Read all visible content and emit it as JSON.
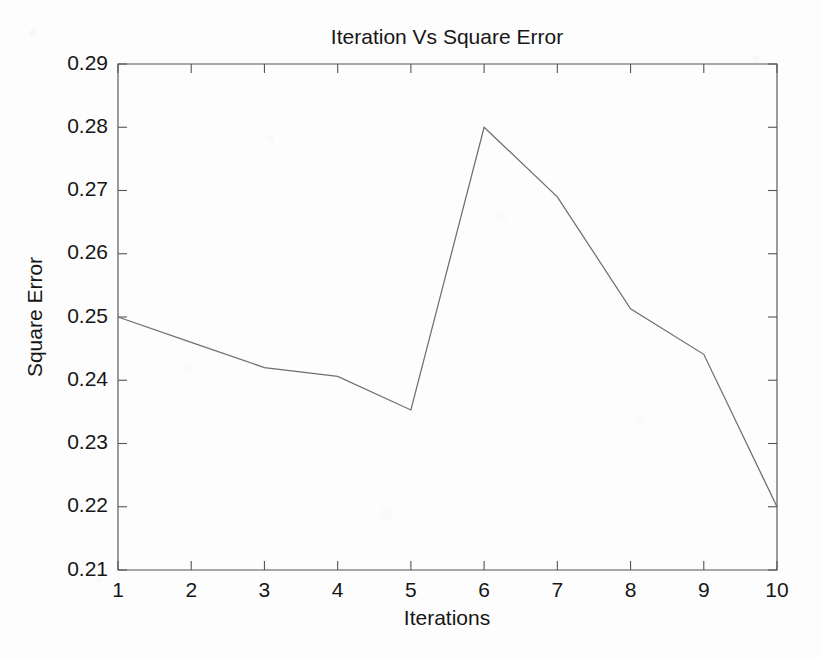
{
  "chart_data": {
    "type": "line",
    "title": "Iteration Vs Square Error",
    "xlabel": "Iterations",
    "ylabel": "Square Error",
    "x": [
      1,
      2,
      3,
      4,
      5,
      6,
      7,
      8,
      9,
      10
    ],
    "values": [
      0.25,
      0.246,
      0.242,
      0.2406,
      0.2353,
      0.28,
      0.269,
      0.2513,
      0.2441,
      0.22
    ],
    "series": [
      {
        "name": "Square Error",
        "values": [
          0.25,
          0.246,
          0.242,
          0.2406,
          0.2353,
          0.28,
          0.269,
          0.2513,
          0.2441,
          0.22
        ]
      }
    ],
    "xlim": [
      1,
      10
    ],
    "ylim": [
      0.21,
      0.29
    ],
    "xticks": [
      1,
      2,
      3,
      4,
      5,
      6,
      7,
      8,
      9,
      10
    ],
    "yticks": [
      0.21,
      0.22,
      0.23,
      0.24,
      0.25,
      0.26,
      0.27,
      0.28,
      0.29
    ],
    "xtick_labels": [
      "1",
      "2",
      "3",
      "4",
      "5",
      "6",
      "7",
      "8",
      "9",
      "10"
    ],
    "ytick_labels": [
      "0.21",
      "0.22",
      "0.23",
      "0.24",
      "0.25",
      "0.26",
      "0.27",
      "0.28",
      "0.29"
    ],
    "grid": false,
    "legend": null,
    "line_color": "#6f6f6f",
    "axis_color": "#555555",
    "background_color": "#fdfdfd",
    "text_color": "#161616"
  }
}
